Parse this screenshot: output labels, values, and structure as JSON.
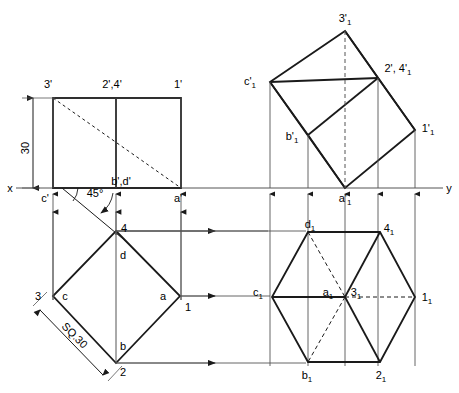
{
  "drawing": {
    "title": "Orthographic projection: square prism - front view, top view, auxiliary views",
    "line_color": "#1a1a1a",
    "thin_line_color": "#555555",
    "background": "#ffffff",
    "axis": {
      "left_label": "x",
      "right_label": "y",
      "y_position": 188
    },
    "dimensions": [
      {
        "name": "height",
        "text": "30"
      },
      {
        "name": "side",
        "text": "SQ.30"
      },
      {
        "name": "angle",
        "text": "45°"
      }
    ],
    "front_view": {
      "name": "front-view",
      "labels": [
        {
          "id": "fv-3p",
          "text": "3'",
          "x": 48,
          "y": 84
        },
        {
          "id": "fv-24p",
          "text": "2',4'",
          "x": 101,
          "y": 84
        },
        {
          "id": "fv-1p",
          "text": "1'",
          "x": 173,
          "y": 84
        },
        {
          "id": "fv-bdp",
          "text": "b',d'",
          "x": 103,
          "y": 183
        },
        {
          "id": "fv-cp",
          "text": "c'",
          "x": 41,
          "y": 201
        },
        {
          "id": "fv-ap",
          "text": "a'",
          "x": 174,
          "y": 201
        }
      ]
    },
    "top_view": {
      "name": "top-view",
      "labels": [
        {
          "id": "tv-4",
          "text": "4",
          "x": 121,
          "y": 229
        },
        {
          "id": "tv-d",
          "text": "d",
          "x": 120,
          "y": 256
        },
        {
          "id": "tv-3",
          "text": "3",
          "x": 36,
          "y": 300
        },
        {
          "id": "tv-c",
          "text": "c",
          "x": 62,
          "y": 300
        },
        {
          "id": "tv-a",
          "text": "a",
          "x": 160,
          "y": 300
        },
        {
          "id": "tv-1",
          "text": "1",
          "x": 185,
          "y": 310
        },
        {
          "id": "tv-b",
          "text": "b",
          "x": 120,
          "y": 348
        },
        {
          "id": "tv-2",
          "text": "2",
          "x": 119,
          "y": 375
        }
      ]
    },
    "aux_front_view": {
      "name": "auxiliary-front-view",
      "labels": [
        {
          "id": "afv-3p1",
          "text": "3'",
          "sub": "1",
          "x": 340,
          "y": 20
        },
        {
          "id": "afv-cp1",
          "text": "c'",
          "sub": "1",
          "x": 246,
          "y": 81
        },
        {
          "id": "afv-2p14p1",
          "text": "2', 4'",
          "sub": "1",
          "x": 383,
          "y": 70
        },
        {
          "id": "afv-bp1",
          "text": "b'",
          "sub": "1",
          "x": 285,
          "y": 138
        },
        {
          "id": "afv-1p1",
          "text": "1'",
          "sub": "1",
          "x": 422,
          "y": 128
        },
        {
          "id": "afv-ap1",
          "text": "a'",
          "sub": "1",
          "x": 340,
          "y": 201
        }
      ]
    },
    "aux_top_view": {
      "name": "auxiliary-top-view",
      "labels": [
        {
          "id": "atv-d1",
          "text": "d",
          "sub": "1",
          "x": 305,
          "y": 228
        },
        {
          "id": "atv-41",
          "text": "4",
          "sub": "1",
          "x": 384,
          "y": 230
        },
        {
          "id": "atv-c1",
          "text": "c",
          "sub": "1",
          "x": 253,
          "y": 294
        },
        {
          "id": "atv-a1",
          "text": "a",
          "sub": "1",
          "x": 323,
          "y": 294
        },
        {
          "id": "atv-31",
          "text": "3",
          "sub": "1",
          "x": 351,
          "y": 294
        },
        {
          "id": "atv-11",
          "text": "1",
          "sub": "1",
          "x": 422,
          "y": 300
        },
        {
          "id": "atv-b1",
          "text": "b",
          "sub": "1",
          "x": 303,
          "y": 378
        },
        {
          "id": "atv-21",
          "text": "2",
          "sub": "1",
          "x": 377,
          "y": 378
        }
      ]
    }
  }
}
